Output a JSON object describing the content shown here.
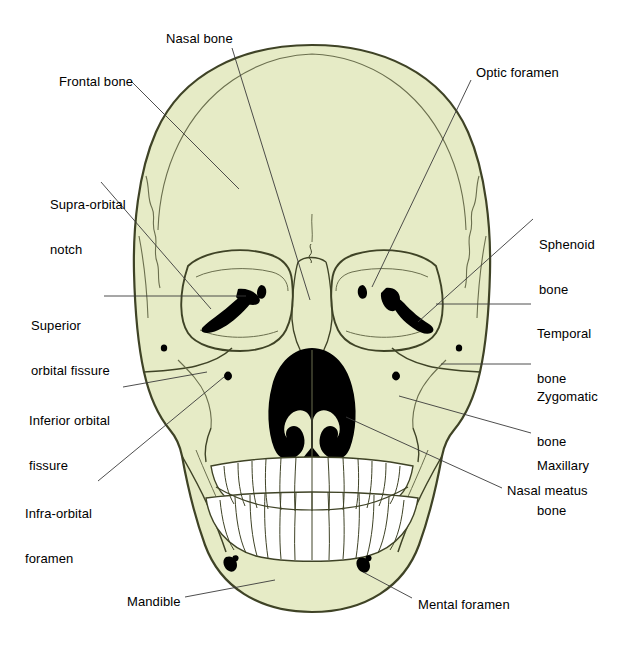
{
  "figure": {
    "kind": "anatomical-diagram",
    "background_color": "#ffffff",
    "bone_fill_color": "#e6ebc6",
    "bone_outline_color": "#3f4326",
    "aperture_color": "#000000",
    "tooth_fill_color": "#ffffff",
    "leader_line_color": "#3a3a3a",
    "label_text_color": "#000000"
  },
  "labels": [
    {
      "id": "nasal-bone",
      "text": "Nasal bone",
      "lines": [
        "Nasal bone"
      ],
      "x": 166,
      "y": 31,
      "align": "left"
    },
    {
      "id": "frontal-bone",
      "text": "Frontal bone",
      "lines": [
        "Frontal bone"
      ],
      "x": 59,
      "y": 74,
      "align": "left"
    },
    {
      "id": "optic-foramen",
      "text": "Optic foramen",
      "lines": [
        "Optic foramen"
      ],
      "x": 476,
      "y": 65,
      "align": "left"
    },
    {
      "id": "supra-orbital-notch",
      "text": "Supra-orbital notch",
      "lines": [
        "Supra-orbital",
        "notch"
      ],
      "x": 50,
      "y": 167,
      "align": "left"
    },
    {
      "id": "sphenoid-bone",
      "text": "Sphenoid bone",
      "lines": [
        "Sphenoid",
        "bone"
      ],
      "x": 539,
      "y": 207,
      "align": "left"
    },
    {
      "id": "superior-orbital-fissure",
      "text": "Superior orbital fissure",
      "lines": [
        "Superior",
        "orbital fissure"
      ],
      "x": 31,
      "y": 288,
      "align": "left"
    },
    {
      "id": "temporal-bone",
      "text": "Temporal bone",
      "lines": [
        "Temporal",
        "bone"
      ],
      "x": 537,
      "y": 296,
      "align": "left"
    },
    {
      "id": "zygomatic-bone",
      "text": "Zygomatic bone",
      "lines": [
        "Zygomatic",
        "bone"
      ],
      "x": 537,
      "y": 359,
      "align": "left"
    },
    {
      "id": "inferior-orbital-fissure",
      "text": "Inferior orbital fissure",
      "lines": [
        "Inferior orbital",
        "fissure"
      ],
      "x": 29,
      "y": 383,
      "align": "left"
    },
    {
      "id": "maxillary-bone",
      "text": "Maxillary bone",
      "lines": [
        "Maxillary",
        "bone"
      ],
      "x": 537,
      "y": 428,
      "align": "left"
    },
    {
      "id": "infra-orbital-foramen",
      "text": "Infra-orbital foramen",
      "lines": [
        "Infra-orbital",
        "foramen"
      ],
      "x": 25,
      "y": 476,
      "align": "left"
    },
    {
      "id": "nasal-meatus",
      "text": "Nasal meatus",
      "lines": [
        "Nasal meatus"
      ],
      "x": 507,
      "y": 483,
      "align": "left"
    },
    {
      "id": "mandible",
      "text": "Mandible",
      "lines": [
        "Mandible"
      ],
      "x": 127,
      "y": 594,
      "align": "left"
    },
    {
      "id": "mental-foramen",
      "text": "Mental foramen",
      "lines": [
        "Mental foramen"
      ],
      "x": 418,
      "y": 597,
      "align": "left"
    }
  ],
  "leaders": [
    {
      "id": "leader-nasal-bone",
      "points": "232,48 310,300"
    },
    {
      "id": "leader-frontal-bone",
      "points": "131,81 239,189"
    },
    {
      "id": "leader-optic-foramen",
      "points": "471,80 372,287"
    },
    {
      "id": "leader-supra-orbital-notch",
      "points": "101,182 211,309"
    },
    {
      "id": "leader-sphenoid-bone",
      "points": "533,219 418,322"
    },
    {
      "id": "leader-superior-orbital-fissure",
      "points": "104,296 246,296"
    },
    {
      "id": "leader-temporal-bone",
      "points": "531,304 436,304"
    },
    {
      "id": "leader-zygomatic-bone",
      "points": "531,364 441,364"
    },
    {
      "id": "leader-inferior-orbital-fissure",
      "points": "123,387 207,372"
    },
    {
      "id": "leader-maxillary-bone",
      "points": "531,433 399,396"
    },
    {
      "id": "leader-infra-orbital-foramen",
      "points": "98,481 224,377"
    },
    {
      "id": "leader-nasal-meatus",
      "points": "502,488 346,417"
    },
    {
      "id": "leader-mandible",
      "points": "185,597 275,580"
    },
    {
      "id": "leader-mental-foramen",
      "points": "412,598 363,572"
    }
  ],
  "features": {
    "foramina": [
      {
        "id": "supra-orbital-notch-left",
        "cx": 164,
        "cy": 348,
        "r": 3
      },
      {
        "id": "supra-orbital-notch-right",
        "cx": 459,
        "cy": 348,
        "r": 3
      },
      {
        "id": "infra-orbital-foramen-left",
        "cx": 228,
        "cy": 376,
        "r": 4
      },
      {
        "id": "infra-orbital-foramen-right",
        "cx": 396,
        "cy": 376,
        "r": 4
      },
      {
        "id": "mental-foramen-left",
        "cx": 229,
        "cy": 562,
        "r": 5
      },
      {
        "id": "mental-foramen-right",
        "cx": 363,
        "cy": 563,
        "r": 5
      }
    ],
    "teeth": {
      "upper_count": 16,
      "lower_count": 16
    }
  }
}
